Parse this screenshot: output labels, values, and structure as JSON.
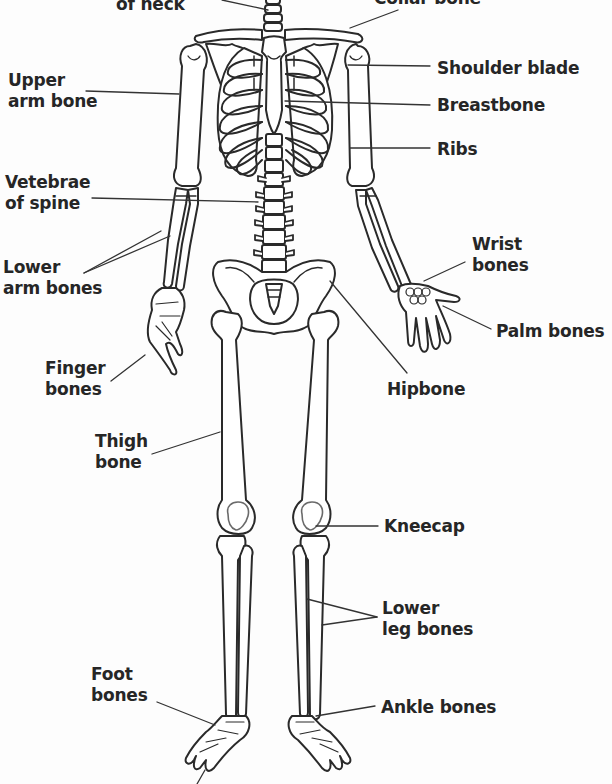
{
  "diagram": {
    "ink_color": "#262626",
    "background": "#fdfdfd",
    "labels": [
      {
        "id": "neck-vertebrae",
        "lines": [
          "of neck"
        ],
        "x": 116,
        "y": -6,
        "align": "left"
      },
      {
        "id": "collar-bone",
        "lines": [
          "Collar bone"
        ],
        "x": 374,
        "y": -12,
        "align": "left"
      },
      {
        "id": "upper-arm-bone",
        "lines": [
          "Upper",
          "arm bone"
        ],
        "x": 8,
        "y": 70,
        "align": "left"
      },
      {
        "id": "shoulder-blade",
        "lines": [
          "Shoulder blade"
        ],
        "x": 437,
        "y": 58,
        "align": "left"
      },
      {
        "id": "breastbone",
        "lines": [
          "Breastbone"
        ],
        "x": 437,
        "y": 95,
        "align": "left"
      },
      {
        "id": "ribs",
        "lines": [
          "Ribs"
        ],
        "x": 437,
        "y": 139,
        "align": "left"
      },
      {
        "id": "vertebrae-of-spine",
        "lines": [
          "Vetebrae",
          "of spine"
        ],
        "x": 5,
        "y": 172,
        "align": "left"
      },
      {
        "id": "wrist-bones",
        "lines": [
          "Wrist",
          "bones"
        ],
        "x": 472,
        "y": 234,
        "align": "left"
      },
      {
        "id": "lower-arm-bones",
        "lines": [
          "Lower",
          "arm bones"
        ],
        "x": 3,
        "y": 257,
        "align": "left"
      },
      {
        "id": "palm-bones",
        "lines": [
          "Palm bones"
        ],
        "x": 496,
        "y": 321,
        "align": "left"
      },
      {
        "id": "finger-bones",
        "lines": [
          "Finger",
          "bones"
        ],
        "x": 45,
        "y": 358,
        "align": "left"
      },
      {
        "id": "hipbone",
        "lines": [
          "Hipbone"
        ],
        "x": 387,
        "y": 379,
        "align": "left"
      },
      {
        "id": "thigh-bone",
        "lines": [
          "Thigh",
          "bone"
        ],
        "x": 95,
        "y": 431,
        "align": "left"
      },
      {
        "id": "kneecap",
        "lines": [
          "Kneecap"
        ],
        "x": 384,
        "y": 516,
        "align": "left"
      },
      {
        "id": "lower-leg-bones",
        "lines": [
          "Lower",
          "leg bones"
        ],
        "x": 382,
        "y": 598,
        "align": "left"
      },
      {
        "id": "foot-bones",
        "lines": [
          "Foot",
          "bones"
        ],
        "x": 91,
        "y": 664,
        "align": "left"
      },
      {
        "id": "ankle-bones",
        "lines": [
          "Ankle bones"
        ],
        "x": 381,
        "y": 697,
        "align": "left"
      }
    ],
    "leader_lines": [
      {
        "for": "neck-vertebrae",
        "x1": 222,
        "y1": 0,
        "x2": 268,
        "y2": 10
      },
      {
        "for": "collar-bone",
        "x1": 398,
        "y1": 10,
        "x2": 350,
        "y2": 28
      },
      {
        "for": "upper-arm-bone",
        "x1": 86,
        "y1": 91,
        "x2": 179,
        "y2": 94
      },
      {
        "for": "shoulder-blade",
        "x1": 348,
        "y1": 65,
        "x2": 430,
        "y2": 66
      },
      {
        "for": "breastbone",
        "x1": 285,
        "y1": 101,
        "x2": 430,
        "y2": 105
      },
      {
        "for": "ribs",
        "x1": 350,
        "y1": 148,
        "x2": 430,
        "y2": 148
      },
      {
        "for": "vertebrae-of-spine",
        "x1": 92,
        "y1": 198,
        "x2": 258,
        "y2": 202
      },
      {
        "for": "wrist-bones",
        "x1": 465,
        "y1": 262,
        "x2": 424,
        "y2": 281
      },
      {
        "for": "lower-arm-bones-a",
        "x1": 84,
        "y1": 273,
        "x2": 161,
        "y2": 231
      },
      {
        "for": "lower-arm-bones-b",
        "x1": 84,
        "y1": 273,
        "x2": 170,
        "y2": 236
      },
      {
        "for": "palm-bones",
        "x1": 491,
        "y1": 329,
        "x2": 443,
        "y2": 306
      },
      {
        "for": "finger-bones",
        "x1": 111,
        "y1": 381,
        "x2": 145,
        "y2": 355
      },
      {
        "for": "hipbone",
        "x1": 407,
        "y1": 373,
        "x2": 330,
        "y2": 281
      },
      {
        "for": "thigh-bone",
        "x1": 152,
        "y1": 454,
        "x2": 220,
        "y2": 432
      },
      {
        "for": "kneecap",
        "x1": 316,
        "y1": 526,
        "x2": 378,
        "y2": 526
      },
      {
        "for": "lower-leg-bones-a",
        "x1": 307,
        "y1": 599,
        "x2": 377,
        "y2": 617
      },
      {
        "for": "lower-leg-bones-b",
        "x1": 322,
        "y1": 625,
        "x2": 377,
        "y2": 617
      },
      {
        "for": "foot-bones",
        "x1": 157,
        "y1": 702,
        "x2": 215,
        "y2": 725
      },
      {
        "for": "ankle-bones",
        "x1": 375,
        "y1": 706,
        "x2": 316,
        "y2": 716
      },
      {
        "for": "toe-cutoff",
        "x1": 205,
        "y1": 770,
        "x2": 197,
        "y2": 784
      }
    ]
  }
}
